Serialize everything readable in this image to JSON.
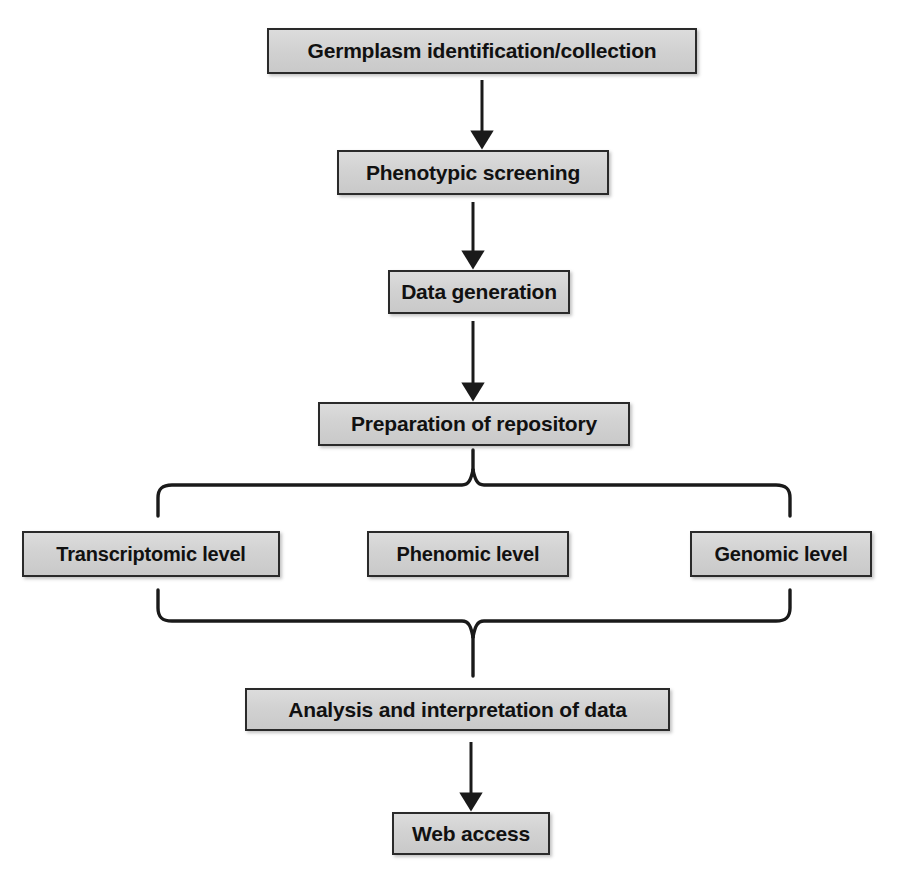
{
  "diagram": {
    "type": "flowchart",
    "orientation": "top-to-bottom",
    "colors": {
      "node_fill": "#d4d4d4",
      "node_border": "#2a2a2a",
      "connector": "#1a1a1a",
      "text": "#111111",
      "background": "#ffffff"
    },
    "nodes": [
      {
        "id": "germplasm",
        "label": "Germplasm identification/collection",
        "level": 1
      },
      {
        "id": "phenotypic",
        "label": "Phenotypic screening",
        "level": 2
      },
      {
        "id": "datagen",
        "label": "Data generation",
        "level": 3
      },
      {
        "id": "repository",
        "label": "Preparation of repository",
        "level": 4
      },
      {
        "id": "transcriptomic",
        "label": "Transcriptomic level",
        "level": 5
      },
      {
        "id": "phenomic",
        "label": "Phenomic level",
        "level": 5
      },
      {
        "id": "genomic",
        "label": "Genomic level",
        "level": 5
      },
      {
        "id": "analysis",
        "label": "Analysis and interpretation of data",
        "level": 6
      },
      {
        "id": "webaccess",
        "label": "Web access",
        "level": 7
      }
    ],
    "connectors": [
      {
        "from": "germplasm",
        "to": "phenotypic",
        "style": "arrow-down"
      },
      {
        "from": "phenotypic",
        "to": "datagen",
        "style": "arrow-down"
      },
      {
        "from": "datagen",
        "to": "repository",
        "style": "arrow-down"
      },
      {
        "from": "repository",
        "to": [
          "transcriptomic",
          "phenomic",
          "genomic"
        ],
        "style": "brace-split-down"
      },
      {
        "from": [
          "transcriptomic",
          "phenomic",
          "genomic"
        ],
        "to": "analysis",
        "style": "brace-merge-down"
      },
      {
        "from": "analysis",
        "to": "webaccess",
        "style": "arrow-down"
      }
    ]
  }
}
